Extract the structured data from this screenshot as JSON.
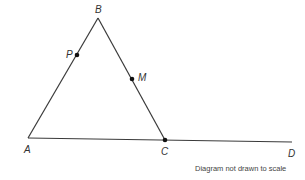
{
  "diagram": {
    "type": "geometry",
    "caption": "Diagram not drawn to scale",
    "colors": {
      "stroke": "#3a3a3a",
      "point": "#111111",
      "label": "#333333",
      "caption": "#444444"
    },
    "points": {
      "A": {
        "label": "A",
        "x": 28,
        "y": 138
      },
      "B": {
        "label": "B",
        "x": 98,
        "y": 18
      },
      "C": {
        "label": "C",
        "x": 165,
        "y": 140
      },
      "D": {
        "label": "D",
        "x": 292,
        "y": 142
      },
      "P": {
        "label": "P",
        "x": 77,
        "y": 55
      },
      "M": {
        "label": "M",
        "x": 132,
        "y": 79
      }
    },
    "segments": [
      {
        "from": "A",
        "to": "B"
      },
      {
        "from": "B",
        "to": "C"
      },
      {
        "from": "A",
        "to": "D"
      }
    ],
    "marked_points": [
      "P",
      "M",
      "C"
    ],
    "labels": {
      "A": "A",
      "B": "B",
      "C": "C",
      "D": "D",
      "P": "P",
      "M": "M"
    }
  }
}
